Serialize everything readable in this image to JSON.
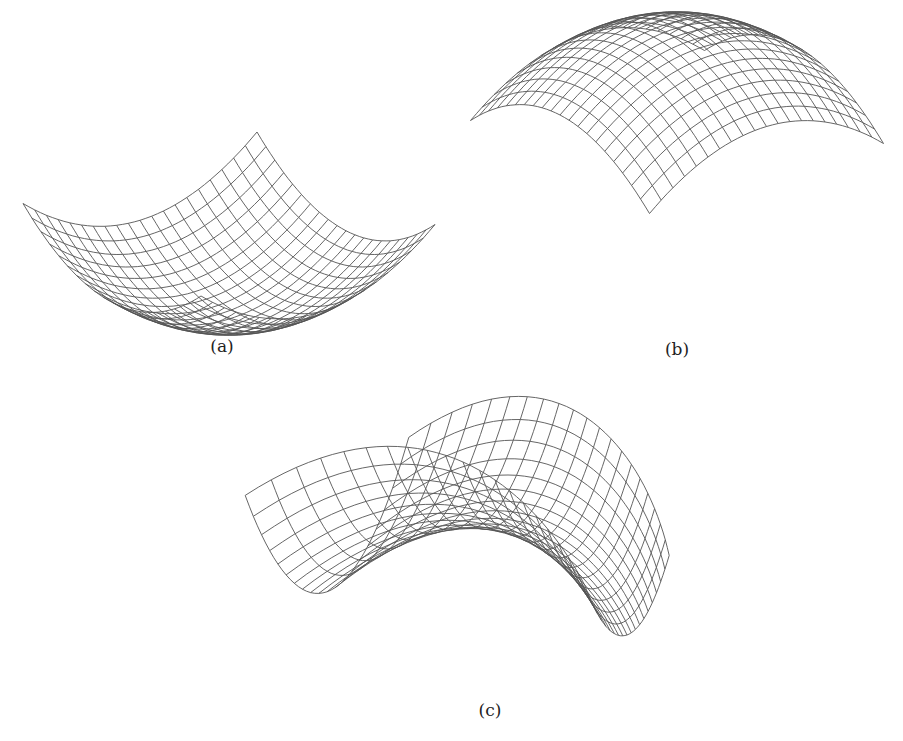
{
  "figure": {
    "panels": [
      {
        "id": "a",
        "caption": "(a)",
        "caption_pos": [
          222,
          336
        ],
        "surface": "convex paraboloid",
        "equation": "z = u^2 + v^2",
        "grid": 21,
        "projection": {
          "O": [
            229,
            319
          ],
          "A": [
            117,
            -35.75
          ],
          "B": [
            -89,
            -46.25
          ],
          "C": [
            0,
            -52.5
          ]
        }
      },
      {
        "id": "b",
        "caption": "(b)",
        "caption_pos": [
          677,
          339
        ],
        "surface": "concave paraboloid",
        "equation": "z = -(u^2 + v^2)",
        "grid": 21,
        "projection": {
          "O": [
            677,
            28
          ],
          "A": [
            117,
            -35
          ],
          "B": [
            -89.5,
            -46.5
          ],
          "C": [
            0,
            -52
          ]
        }
      },
      {
        "id": "c",
        "caption": "(c)",
        "caption_pos": [
          490,
          700
        ],
        "surface": "saddle",
        "equation": "z = v^2 - u^2",
        "grid": 21,
        "projection": {
          "O": [
            525,
            535
          ],
          "A": [
            -150,
            -52
          ],
          "B": [
            62,
            -22
          ],
          "C": [
            0,
            -95
          ],
          "persp": [
            0.32,
            0
          ]
        }
      }
    ]
  },
  "colors": {
    "mesh": "#555555",
    "text": "#222222",
    "background": "#ffffff"
  }
}
